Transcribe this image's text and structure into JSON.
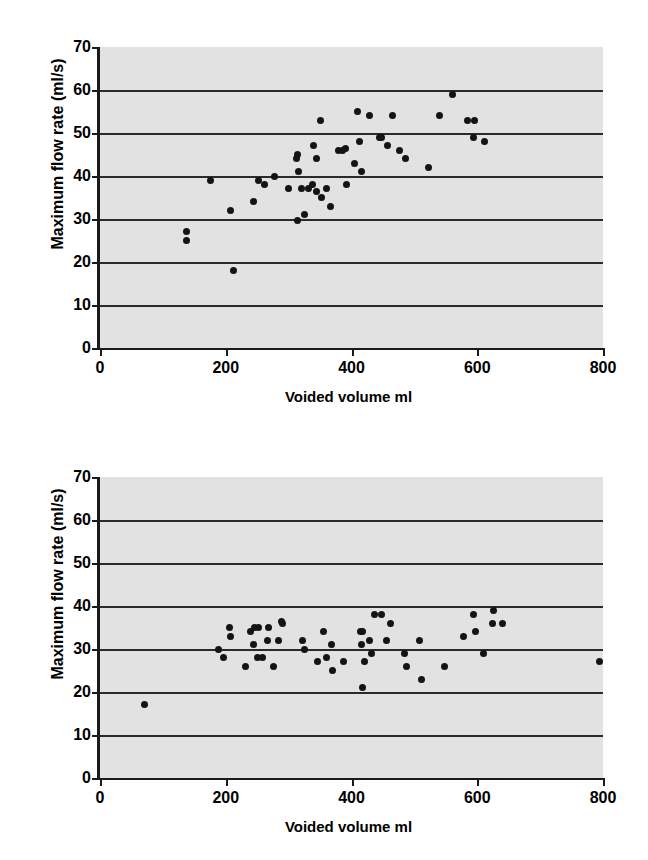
{
  "figure": {
    "panels": [
      "top",
      "bottom"
    ]
  },
  "chart_data": [
    {
      "type": "scatter",
      "panel": "top",
      "title": "",
      "xlabel": "Voided volume ml",
      "ylabel": "Maximum flow rate (ml/s)",
      "xlim": [
        0,
        800
      ],
      "ylim": [
        0,
        70
      ],
      "xticks": [
        0,
        200,
        400,
        600,
        800
      ],
      "yticks": [
        0,
        10,
        20,
        30,
        40,
        50,
        60,
        70
      ],
      "grid": "horizontal",
      "legend": "none",
      "background": "#e2e2e2",
      "marker_color": "#141414",
      "points": [
        {
          "x": 138,
          "y": 27
        },
        {
          "x": 138,
          "y": 25
        },
        {
          "x": 175,
          "y": 39
        },
        {
          "x": 212,
          "y": 18
        },
        {
          "x": 208,
          "y": 32
        },
        {
          "x": 244,
          "y": 34
        },
        {
          "x": 252,
          "y": 39
        },
        {
          "x": 262,
          "y": 38
        },
        {
          "x": 278,
          "y": 40
        },
        {
          "x": 300,
          "y": 37
        },
        {
          "x": 312,
          "y": 44
        },
        {
          "x": 314,
          "y": 45
        },
        {
          "x": 316,
          "y": 41
        },
        {
          "x": 314,
          "y": 29.7
        },
        {
          "x": 320,
          "y": 37
        },
        {
          "x": 326,
          "y": 31
        },
        {
          "x": 332,
          "y": 37
        },
        {
          "x": 338,
          "y": 38
        },
        {
          "x": 340,
          "y": 47
        },
        {
          "x": 344,
          "y": 44
        },
        {
          "x": 344,
          "y": 36.5
        },
        {
          "x": 350,
          "y": 53
        },
        {
          "x": 352,
          "y": 35
        },
        {
          "x": 360,
          "y": 37
        },
        {
          "x": 366,
          "y": 33
        },
        {
          "x": 380,
          "y": 46
        },
        {
          "x": 386,
          "y": 46
        },
        {
          "x": 390,
          "y": 46.5
        },
        {
          "x": 392,
          "y": 38
        },
        {
          "x": 404,
          "y": 43
        },
        {
          "x": 410,
          "y": 55
        },
        {
          "x": 412,
          "y": 48
        },
        {
          "x": 416,
          "y": 41
        },
        {
          "x": 428,
          "y": 54
        },
        {
          "x": 444,
          "y": 49
        },
        {
          "x": 448,
          "y": 49
        },
        {
          "x": 458,
          "y": 47
        },
        {
          "x": 466,
          "y": 54
        },
        {
          "x": 476,
          "y": 46
        },
        {
          "x": 486,
          "y": 44
        },
        {
          "x": 522,
          "y": 42
        },
        {
          "x": 540,
          "y": 54
        },
        {
          "x": 560,
          "y": 59
        },
        {
          "x": 584,
          "y": 53
        },
        {
          "x": 596,
          "y": 53
        },
        {
          "x": 594,
          "y": 49
        },
        {
          "x": 612,
          "y": 48
        }
      ]
    },
    {
      "type": "scatter",
      "panel": "bottom",
      "title": "",
      "xlabel": "Voided volume ml",
      "ylabel": "Maximum flow rate (ml/s)",
      "xlim": [
        0,
        800
      ],
      "ylim": [
        0,
        70
      ],
      "xticks": [
        0,
        200,
        400,
        600,
        800
      ],
      "yticks": [
        0,
        10,
        20,
        30,
        40,
        50,
        60,
        70
      ],
      "grid": "horizontal",
      "legend": "none",
      "background": "#e2e2e2",
      "marker_color": "#141414",
      "points": [
        {
          "x": 70,
          "y": 17
        },
        {
          "x": 188,
          "y": 30
        },
        {
          "x": 196,
          "y": 28
        },
        {
          "x": 206,
          "y": 35
        },
        {
          "x": 208,
          "y": 33
        },
        {
          "x": 232,
          "y": 26
        },
        {
          "x": 240,
          "y": 34
        },
        {
          "x": 244,
          "y": 31
        },
        {
          "x": 246,
          "y": 35
        },
        {
          "x": 252,
          "y": 35
        },
        {
          "x": 250,
          "y": 28
        },
        {
          "x": 258,
          "y": 28
        },
        {
          "x": 266,
          "y": 32
        },
        {
          "x": 268,
          "y": 35
        },
        {
          "x": 276,
          "y": 26
        },
        {
          "x": 284,
          "y": 32
        },
        {
          "x": 290,
          "y": 36
        },
        {
          "x": 288,
          "y": 36.5
        },
        {
          "x": 322,
          "y": 32
        },
        {
          "x": 326,
          "y": 30
        },
        {
          "x": 346,
          "y": 27
        },
        {
          "x": 356,
          "y": 34
        },
        {
          "x": 360,
          "y": 28
        },
        {
          "x": 368,
          "y": 31
        },
        {
          "x": 370,
          "y": 25
        },
        {
          "x": 388,
          "y": 27
        },
        {
          "x": 414,
          "y": 34
        },
        {
          "x": 418,
          "y": 34
        },
        {
          "x": 416,
          "y": 31
        },
        {
          "x": 418,
          "y": 21
        },
        {
          "x": 420,
          "y": 27
        },
        {
          "x": 428,
          "y": 32
        },
        {
          "x": 432,
          "y": 29
        },
        {
          "x": 436,
          "y": 38
        },
        {
          "x": 448,
          "y": 38
        },
        {
          "x": 456,
          "y": 32
        },
        {
          "x": 462,
          "y": 36
        },
        {
          "x": 484,
          "y": 29
        },
        {
          "x": 488,
          "y": 26
        },
        {
          "x": 508,
          "y": 32
        },
        {
          "x": 512,
          "y": 23
        },
        {
          "x": 548,
          "y": 26
        },
        {
          "x": 578,
          "y": 33
        },
        {
          "x": 594,
          "y": 38
        },
        {
          "x": 598,
          "y": 34
        },
        {
          "x": 610,
          "y": 29
        },
        {
          "x": 626,
          "y": 39
        },
        {
          "x": 624,
          "y": 36
        },
        {
          "x": 640,
          "y": 36
        },
        {
          "x": 794,
          "y": 27
        }
      ]
    }
  ]
}
